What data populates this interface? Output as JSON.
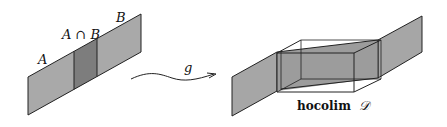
{
  "labels": {
    "a": "A",
    "b": "B",
    "intersection": "A ∩ B",
    "map": "g",
    "colimit_word": "hocolim",
    "colimit_symbol": "𝒟"
  },
  "colors": {
    "panel_fill": "#a6a6a6",
    "overlap_fill": "#7a7a7a",
    "box_fill": "#9c9c9c",
    "stroke": "#222222",
    "background": "#ffffff"
  }
}
